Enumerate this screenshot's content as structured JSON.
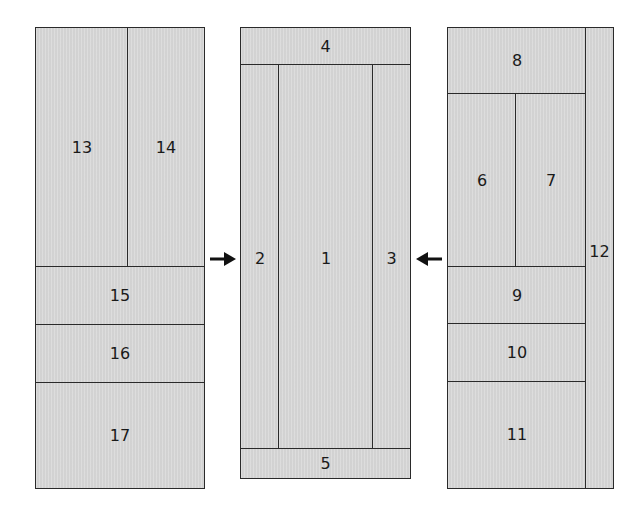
{
  "diagram": {
    "type": "quilt-block assembly",
    "colors": {
      "fabric": "#d9d9d9",
      "seam": "#2a2a2a",
      "background": "#ffffff",
      "arrow": "#111111"
    },
    "left_panel": {
      "pieces": [
        {
          "id": "13",
          "label": "13"
        },
        {
          "id": "14",
          "label": "14"
        },
        {
          "id": "15",
          "label": "15"
        },
        {
          "id": "16",
          "label": "16"
        },
        {
          "id": "17",
          "label": "17"
        }
      ]
    },
    "center_panel": {
      "pieces": [
        {
          "id": "4",
          "label": "4"
        },
        {
          "id": "2",
          "label": "2"
        },
        {
          "id": "1",
          "label": "1"
        },
        {
          "id": "3",
          "label": "3"
        },
        {
          "id": "5",
          "label": "5"
        }
      ]
    },
    "right_panel": {
      "pieces": [
        {
          "id": "8",
          "label": "8"
        },
        {
          "id": "6",
          "label": "6"
        },
        {
          "id": "7",
          "label": "7"
        },
        {
          "id": "9",
          "label": "9"
        },
        {
          "id": "10",
          "label": "10"
        },
        {
          "id": "11",
          "label": "11"
        },
        {
          "id": "12",
          "label": "12"
        }
      ]
    },
    "arrows": [
      {
        "name": "arrow-left-to-center",
        "direction": "right"
      },
      {
        "name": "arrow-right-to-center",
        "direction": "left"
      }
    ]
  }
}
